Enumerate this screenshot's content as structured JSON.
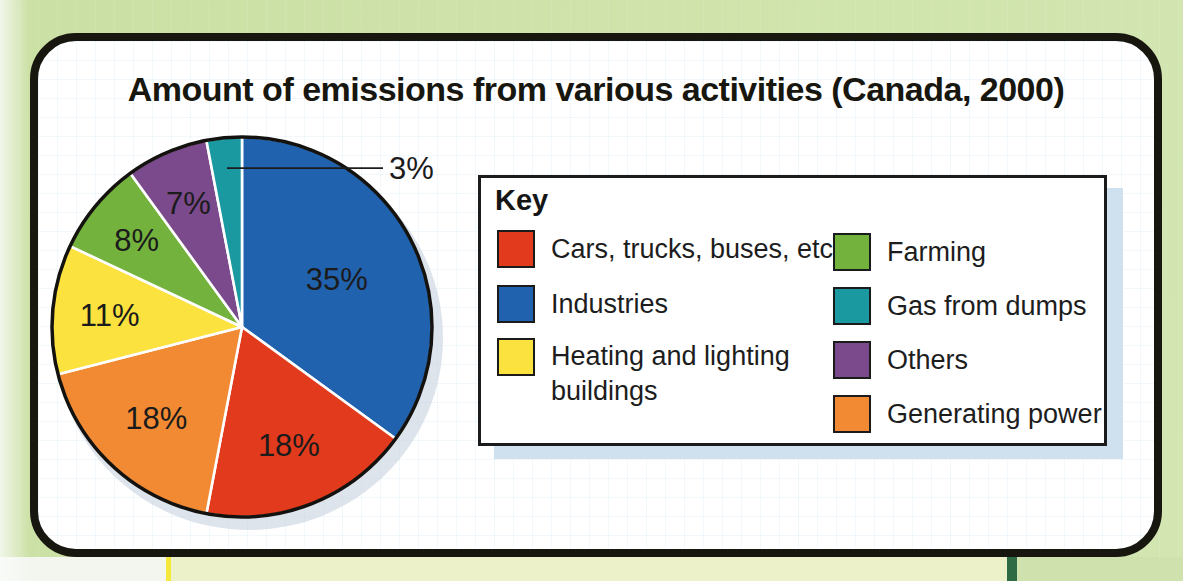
{
  "title": "Amount of emissions from various activities (Canada, 2000)",
  "chart_data": {
    "type": "pie",
    "title": "Amount of emissions from various activities (Canada, 2000)",
    "start": "12-oclock",
    "direction": "clockwise",
    "units": "percent",
    "slices": [
      {
        "label": "Industries",
        "value": 35,
        "display": "35%",
        "color": "#2162ae",
        "label_r": 0.56
      },
      {
        "label": "Cars, trucks, buses, etc.",
        "value": 18,
        "display": "18%",
        "color": "#e23a1d",
        "label_r": 0.67
      },
      {
        "label": "Generating power",
        "value": 18,
        "display": "18%",
        "color": "#f18a33",
        "label_r": 0.66
      },
      {
        "label": "Heating and lighting buildings",
        "value": 11,
        "display": "11%",
        "color": "#fbe23e",
        "label_r": 0.7
      },
      {
        "label": "Farming",
        "value": 8,
        "display": "8%",
        "color": "#74b23e",
        "label_r": 0.72
      },
      {
        "label": "Others",
        "value": 7,
        "display": "7%",
        "color": "#7b4a8c",
        "label_r": 0.71
      },
      {
        "label": "Gas from dumps",
        "value": 3,
        "display": "3%",
        "color": "#1a99a1",
        "callout": true
      }
    ],
    "legend_position": "right"
  },
  "key": {
    "heading": "Key",
    "columns": [
      [
        {
          "label": "Cars, trucks, buses, etc.",
          "color": "#e23a1d"
        },
        {
          "label": "Industries",
          "color": "#2162ae"
        },
        {
          "label": "Heating and lighting buildings",
          "color": "#fbe23e"
        }
      ],
      [
        {
          "label": "Farming",
          "color": "#74b23e"
        },
        {
          "label": "Gas from dumps",
          "color": "#1a99a1"
        },
        {
          "label": "Others",
          "color": "#7b4a8c"
        },
        {
          "label": "Generating power",
          "color": "#f18a33"
        }
      ]
    ]
  },
  "colors": {
    "page_background": "#cde1a9",
    "card_background": "#ffffff",
    "card_border": "#17160f",
    "key_shadow": "#cfe0ee",
    "pie_shadow": "#c9d3e0",
    "label_text": "#1b1b1b"
  }
}
